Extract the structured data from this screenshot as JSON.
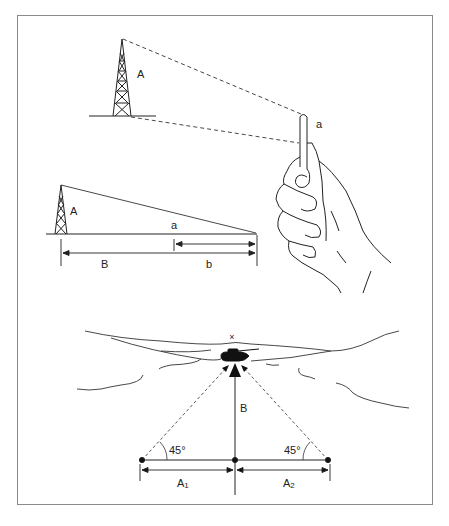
{
  "figure": {
    "type": "technical-illustration",
    "panels": [
      {
        "id": "thumb-sight",
        "description": "Observer holds a pencil/stick at arm's length to sight a tower",
        "labels": {
          "tower_height": "A",
          "stick_length": "a"
        }
      },
      {
        "id": "similar-triangles",
        "description": "Similar triangles relating tower height and sighting stick to distance",
        "labels": {
          "tower_height": "A",
          "stick_height": "a",
          "total_distance": "B",
          "arm_distance": "b"
        }
      },
      {
        "id": "45-degree-method",
        "description": "Range to target measured by offset points at 45 degrees",
        "labels": {
          "range": "B",
          "left_angle": "45°",
          "right_angle": "45°",
          "left_offset": "A",
          "left_offset_sub": "1",
          "right_offset": "A",
          "right_offset_sub": "2",
          "target_marker": "×"
        }
      }
    ],
    "colors": {
      "line": "#222222",
      "frame": "#8a8a8a",
      "background": "#ffffff"
    }
  }
}
